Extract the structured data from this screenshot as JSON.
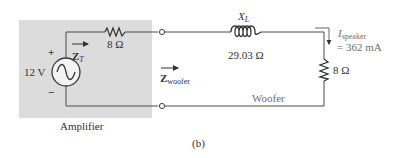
{
  "figure_label": "(b)",
  "amplifier": {
    "label": "Amplifier",
    "box_color": "#dcdcdc",
    "source": {
      "voltage": "12 V",
      "plus": "+",
      "minus": "−"
    },
    "internal_resistor": {
      "value": "8 Ω"
    },
    "impedance_label": {
      "main": "Z",
      "sub": "T"
    }
  },
  "inductor": {
    "label_main": "X",
    "label_sub": "L",
    "value": "29.03 Ω"
  },
  "woofer": {
    "label": "Woofer",
    "impedance_label": {
      "main": "Z",
      "sub": "woofer"
    },
    "resistor": {
      "value": "8 Ω"
    }
  },
  "current": {
    "label_main": "I",
    "label_sub": "speaker",
    "value": "= 362 mA"
  },
  "colors": {
    "wire": "#4a4a4a",
    "box": "#dcdcdc",
    "woofer_line": "#8a8a8a"
  }
}
